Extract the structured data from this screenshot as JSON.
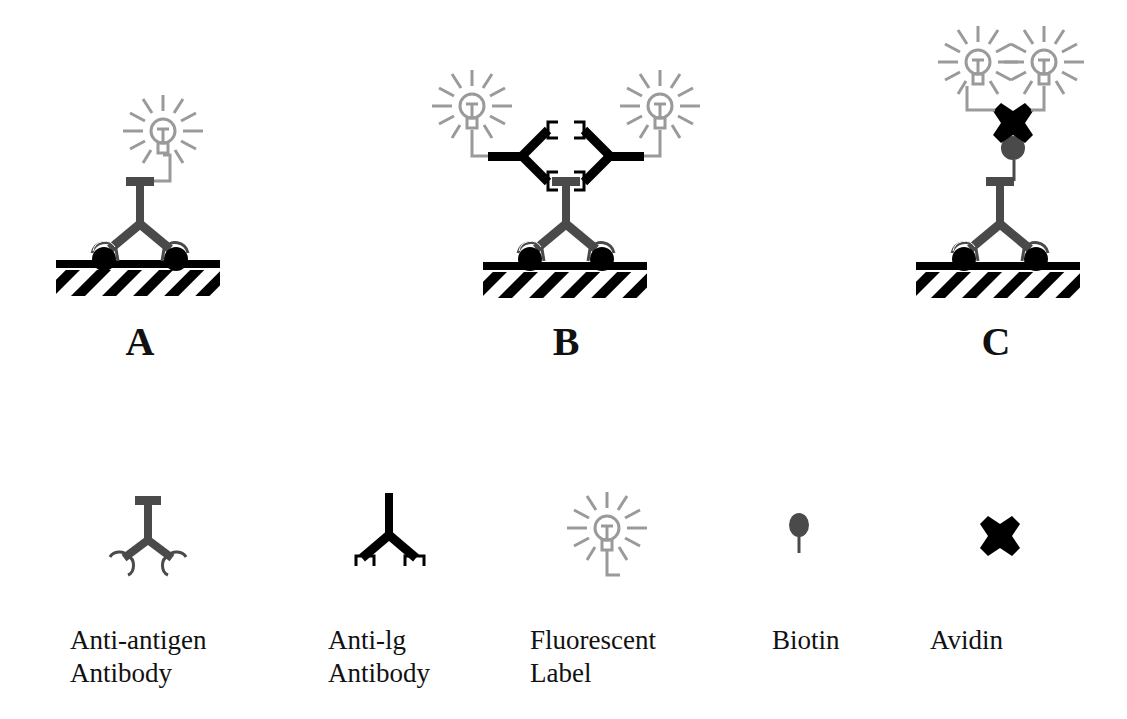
{
  "panels": [
    {
      "id": "A",
      "label": "A",
      "x": 140
    },
    {
      "id": "B",
      "label": "B",
      "x": 565
    },
    {
      "id": "C",
      "label": "C",
      "x": 995
    }
  ],
  "legend": [
    {
      "key": "anti-antigen-antibody",
      "line1": "Anti-antigen",
      "line2": "Antibody"
    },
    {
      "key": "anti-ig-antibody",
      "line1": "Anti-lg",
      "line2": "Antibody"
    },
    {
      "key": "fluorescent-label",
      "line1": "Fluorescent",
      "line2": "Label"
    },
    {
      "key": "biotin",
      "line1": "Biotin",
      "line2": ""
    },
    {
      "key": "avidin",
      "line1": "Avidin",
      "line2": ""
    }
  ],
  "colors": {
    "anti_antigen_antibody": "#4a4a4a",
    "anti_ig_antibody": "#000000",
    "fluorescent_label": "#9a9a9a",
    "biotin": "#4a4a4a",
    "avidin": "#000000",
    "surface": "#000000",
    "antigen": "#000000"
  }
}
